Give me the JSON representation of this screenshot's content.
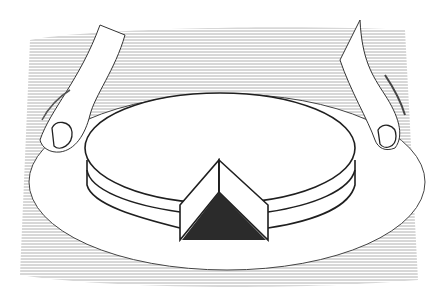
{
  "illustration": {
    "subject": "hands holding a plate with a round cake missing a wedge",
    "colors": {
      "background": "#ffffff",
      "shading": "#9a9a9a",
      "ink": "#222222",
      "wedge_shadow": "#1e1e1e"
    }
  }
}
